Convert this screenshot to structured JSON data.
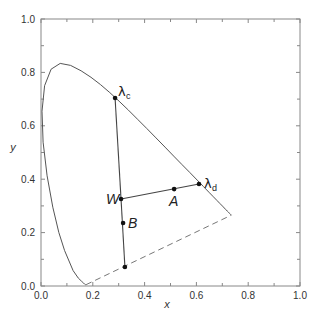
{
  "chart_data": {
    "type": "scatter",
    "title": "",
    "xlabel": "x",
    "ylabel": "y",
    "xlim": [
      0.0,
      1.0
    ],
    "ylim": [
      0.0,
      1.0
    ],
    "grid": false,
    "x_ticks": [
      "0.0",
      "0.2",
      "0.4",
      "0.6",
      "0.8",
      "1.0"
    ],
    "y_ticks": [
      "0.0",
      "0.2",
      "0.4",
      "0.6",
      "0.8",
      "1.0"
    ],
    "spectral_locus": {
      "x": [
        0.1741,
        0.174,
        0.1738,
        0.1736,
        0.1733,
        0.1726,
        0.1714,
        0.1689,
        0.1644,
        0.1566,
        0.144,
        0.1241,
        0.0913,
        0.0687,
        0.0454,
        0.0235,
        0.0082,
        0.0039,
        0.0139,
        0.0389,
        0.0743,
        0.1142,
        0.1547,
        0.1929,
        0.2296,
        0.2658,
        0.3016,
        0.3373,
        0.3731,
        0.4087,
        0.4441,
        0.4788,
        0.5125,
        0.5448,
        0.5752,
        0.6029,
        0.627,
        0.6482,
        0.6658,
        0.6801,
        0.6915,
        0.7006,
        0.7079,
        0.714,
        0.719,
        0.723,
        0.726,
        0.7283,
        0.73,
        0.732,
        0.7347
      ],
      "y": [
        0.005,
        0.005,
        0.0049,
        0.0049,
        0.0048,
        0.0048,
        0.0051,
        0.0069,
        0.0109,
        0.0177,
        0.0297,
        0.0578,
        0.1327,
        0.2007,
        0.295,
        0.4127,
        0.5384,
        0.6548,
        0.7502,
        0.812,
        0.8338,
        0.8262,
        0.8059,
        0.7816,
        0.7543,
        0.7243,
        0.6923,
        0.6589,
        0.6245,
        0.5896,
        0.5547,
        0.5202,
        0.4866,
        0.4544,
        0.4242,
        0.3965,
        0.3725,
        0.3514,
        0.334,
        0.3197,
        0.3083,
        0.2993,
        0.292,
        0.2859,
        0.2809,
        0.277,
        0.274,
        0.2717,
        0.27,
        0.268,
        0.2653
      ]
    },
    "purple_line": {
      "from": [
        0.1741,
        0.005
      ],
      "to": [
        0.7347,
        0.2653
      ],
      "style": "dashed"
    },
    "points": [
      {
        "name": "lambda_c",
        "label": "λ",
        "subscript": "c",
        "x": 0.286,
        "y": 0.704
      },
      {
        "name": "W",
        "label": "W",
        "x": 0.309,
        "y": 0.326
      },
      {
        "name": "A",
        "label": "A",
        "x": 0.514,
        "y": 0.363
      },
      {
        "name": "lambda_d",
        "label": "λ",
        "subscript": "d",
        "x": 0.61,
        "y": 0.382
      },
      {
        "name": "B",
        "label": "B",
        "x": 0.317,
        "y": 0.236
      },
      {
        "name": "purple_point",
        "label": "",
        "x": 0.324,
        "y": 0.071
      }
    ],
    "lines": [
      {
        "from": "W",
        "to": "lambda_c"
      },
      {
        "from": "W",
        "to": "lambda_d"
      },
      {
        "from": "W",
        "to": "purple_point"
      }
    ]
  },
  "axes": {
    "xlabel": "x",
    "ylabel": "y",
    "x_ticks": [
      "0.0",
      "0.2",
      "0.4",
      "0.6",
      "0.8",
      "1.0"
    ],
    "y_ticks": [
      "0.0",
      "0.2",
      "0.4",
      "0.6",
      "0.8",
      "1.0"
    ]
  },
  "labels": {
    "lambda_c_main": "λ",
    "lambda_c_sub": "c",
    "lambda_d_main": "λ",
    "lambda_d_sub": "d",
    "W": "W",
    "A": "A",
    "B": "B"
  },
  "colors": {
    "axis": "#888888",
    "curve": "#555555",
    "line": "#444444",
    "point": "#111111",
    "dashed": "#777777"
  }
}
